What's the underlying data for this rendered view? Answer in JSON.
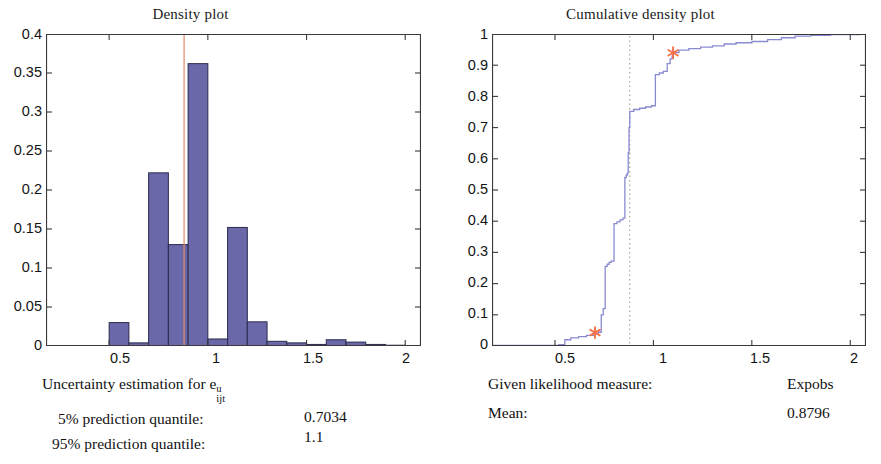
{
  "figure": {
    "background": "#ffffff",
    "bar_fill": "#6a68a8",
    "bar_edge": "#2b2b4f",
    "curve_color": "#8a8ad0",
    "marker_color": "#f4734a",
    "mean_line_color": "#e08a6a",
    "axis_color": "#3a3a3a"
  },
  "left_panel": {
    "title": "Density plot",
    "caption_prefix": "Uncertainty estimation for ",
    "caption_var": "e",
    "caption_sup": "u",
    "caption_sub": "ijt",
    "rows": [
      {
        "label": "5%  prediction quantile:",
        "value": "0.7034"
      },
      {
        "label": "95% prediction quantile:",
        "value": "1.1"
      }
    ]
  },
  "right_panel": {
    "title": "Cumulative density plot",
    "rows": [
      {
        "label": "Given likelihood measure:",
        "value": "Expobs"
      },
      {
        "label": "Mean:",
        "value": "0.8796"
      }
    ]
  },
  "chart_data": [
    {
      "type": "bar",
      "id": "density-histogram",
      "title": "Density plot",
      "xlabel": "",
      "ylabel": "",
      "xlim": [
        0.18,
        2.08
      ],
      "ylim": [
        0,
        0.4
      ],
      "xticks": [
        0.5,
        1,
        1.5,
        2
      ],
      "xtick_labels": [
        "0.5",
        "1",
        "1.5",
        "2"
      ],
      "yticks": [
        0,
        0.05,
        0.1,
        0.15,
        0.2,
        0.25,
        0.3,
        0.35,
        0.4
      ],
      "ytick_labels": [
        "0",
        "0.05",
        "0.1",
        "0.15",
        "0.2",
        "0.25",
        "0.3",
        "0.35",
        "0.4"
      ],
      "grid": false,
      "bin_width": 0.1,
      "bin_left_edges": [
        0.5,
        0.6,
        0.7,
        0.8,
        0.9,
        1.0,
        1.1,
        1.2,
        1.3,
        1.4,
        1.5,
        1.6,
        1.7,
        1.8,
        1.9
      ],
      "values": [
        0.03,
        0.004,
        0.222,
        0.13,
        0.362,
        0.009,
        0.152,
        0.031,
        0.006,
        0.004,
        0.002,
        0.008,
        0.005,
        0.002,
        0.001
      ],
      "mean_marker_x": 0.8796,
      "mean_marker_color": "#e08a6a"
    },
    {
      "type": "line",
      "id": "cumulative-density",
      "title": "Cumulative density plot",
      "xlabel": "",
      "ylabel": "",
      "xlim": [
        0.18,
        2.08
      ],
      "ylim": [
        0,
        1
      ],
      "xticks": [
        0.5,
        1,
        1.5,
        2
      ],
      "xtick_labels": [
        "0.5",
        "1",
        "1.5",
        "2"
      ],
      "yticks": [
        0,
        0.1,
        0.2,
        0.3,
        0.4,
        0.5,
        0.6,
        0.7,
        0.8,
        0.9,
        1
      ],
      "ytick_labels": [
        "0",
        "0.1",
        "0.2",
        "0.3",
        "0.4",
        "0.5",
        "0.6",
        "0.7",
        "0.8",
        "0.9",
        "1"
      ],
      "grid": false,
      "step": true,
      "series": [
        {
          "name": "Empirical CDF",
          "color": "#8a8ad0",
          "x": [
            0.18,
            0.52,
            0.55,
            0.58,
            0.62,
            0.66,
            0.7,
            0.72,
            0.735,
            0.745,
            0.755,
            0.765,
            0.775,
            0.785,
            0.8,
            0.815,
            0.83,
            0.845,
            0.855,
            0.862,
            0.868,
            0.872,
            0.876,
            0.88,
            0.9,
            0.93,
            0.96,
            0.99,
            1.01,
            1.03,
            1.05,
            1.07,
            1.085,
            1.095,
            1.1,
            1.13,
            1.18,
            1.24,
            1.3,
            1.36,
            1.42,
            1.5,
            1.58,
            1.65,
            1.72,
            1.8,
            1.9,
            2.05
          ],
          "y": [
            0.002,
            0.004,
            0.02,
            0.026,
            0.03,
            0.034,
            0.04,
            0.044,
            0.1,
            0.12,
            0.255,
            0.262,
            0.268,
            0.272,
            0.392,
            0.398,
            0.404,
            0.41,
            0.54,
            0.548,
            0.555,
            0.62,
            0.7,
            0.752,
            0.758,
            0.762,
            0.766,
            0.77,
            0.87,
            0.875,
            0.88,
            0.905,
            0.92,
            0.93,
            0.94,
            0.948,
            0.953,
            0.958,
            0.962,
            0.968,
            0.972,
            0.976,
            0.982,
            0.988,
            0.993,
            0.996,
            0.998,
            0.999
          ]
        }
      ],
      "markers": [
        {
          "x": 0.7034,
          "y": 0.043,
          "symbol": "asterisk",
          "color": "#f4734a",
          "label": "5% prediction quantile"
        },
        {
          "x": 1.1,
          "y": 0.94,
          "symbol": "asterisk",
          "color": "#f4734a",
          "label": "95% prediction quantile"
        }
      ],
      "vlines": [
        {
          "x": 0.8796,
          "style": "dotted",
          "color": "#a9a99a",
          "label": "Mean"
        }
      ]
    }
  ]
}
